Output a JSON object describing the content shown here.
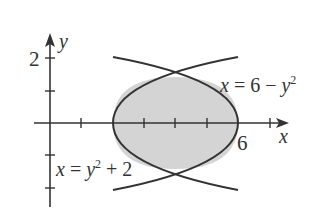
{
  "figure": {
    "axes": {
      "x_label": "x",
      "y_label": "y",
      "x_tick_label": "6",
      "y_tick_label": "2",
      "x_ticks": [
        1,
        2,
        3,
        4,
        5,
        6,
        7
      ],
      "y_ticks": [
        -2,
        -1,
        1,
        2
      ]
    },
    "curves": [
      {
        "name": "right-opening",
        "equation_lhs": "x = y",
        "equation_sup": "2",
        "equation_rhs": " + 2"
      },
      {
        "name": "left-opening",
        "equation_lhs": "x = 6 − y",
        "equation_sup": "2",
        "equation_rhs": ""
      }
    ],
    "region": {
      "fill": "#d4d4d4",
      "stroke": "#333333",
      "intersections": [
        "(4, √2)",
        "(4, −√2)"
      ]
    }
  }
}
